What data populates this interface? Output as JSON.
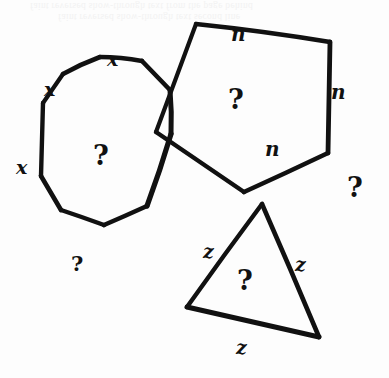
{
  "page": {
    "background_color": "#fdfdfd",
    "ink_color": "#111111",
    "width": 389,
    "height": 378
  },
  "bleed_through_text": {
    "line1": "faint reversed show-through text from the page behind",
    "line2": "faint reversed show-through text second line"
  },
  "shapes": [
    {
      "id": "octagon",
      "name": "octagon",
      "sides": 8,
      "side_label": "x",
      "interior_label": "?",
      "points": "43,102 63,73 99,56 142,60 170,89 171,133 146,206 103,224 61,209 40,175"
    },
    {
      "id": "pentagon",
      "name": "pentagon",
      "sides": 5,
      "side_label": "n",
      "interior_label": "?",
      "points": "189,57 196,23 330,41 327,153 243,192 155,131"
    },
    {
      "id": "triangle",
      "name": "triangle",
      "sides": 3,
      "side_label": "z",
      "interior_label": "?",
      "points": "262,203 319,337 186,306"
    }
  ],
  "labels": [
    {
      "id": "x-top",
      "text": "x",
      "kind": "x",
      "x": 107,
      "y": 50
    },
    {
      "id": "x-upper-left",
      "text": "x",
      "kind": "x",
      "x": 44,
      "y": 80
    },
    {
      "id": "x-left",
      "text": "x",
      "kind": "x",
      "x": 16,
      "y": 158
    },
    {
      "id": "n-top",
      "text": "n",
      "kind": "n",
      "x": 231,
      "y": 24
    },
    {
      "id": "n-right",
      "text": "n",
      "kind": "n",
      "x": 331,
      "y": 82
    },
    {
      "id": "n-inner",
      "text": "n",
      "kind": "n",
      "x": 265,
      "y": 139
    },
    {
      "id": "z-left",
      "text": "z",
      "kind": "z",
      "x": 203,
      "y": 242
    },
    {
      "id": "z-right",
      "text": "z",
      "kind": "z",
      "x": 295,
      "y": 255
    },
    {
      "id": "z-bottom",
      "text": "z",
      "kind": "z",
      "x": 236,
      "y": 338
    },
    {
      "id": "q-octagon",
      "text": "?",
      "kind": "q",
      "x": 93,
      "y": 142
    },
    {
      "id": "q-pentagon",
      "text": "?",
      "kind": "q",
      "x": 228,
      "y": 86
    },
    {
      "id": "q-triangle",
      "text": "?",
      "kind": "q",
      "x": 237,
      "y": 267
    },
    {
      "id": "q-right",
      "text": "?",
      "kind": "q",
      "x": 347,
      "y": 174
    },
    {
      "id": "q-below-octagon",
      "text": "?",
      "kind": "q-small",
      "x": 71,
      "y": 253
    }
  ]
}
